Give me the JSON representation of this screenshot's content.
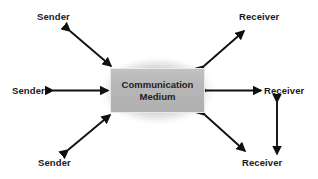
{
  "diagram": {
    "center_node": {
      "label": "Communication\nMedium",
      "fill_color": "#b7b7b7",
      "border_color": "#e9e9e9"
    },
    "senders": [
      {
        "id": "sender-top",
        "label": "Sender"
      },
      {
        "id": "sender-mid",
        "label": "Sender"
      },
      {
        "id": "sender-bottom",
        "label": "Sender"
      }
    ],
    "receivers": [
      {
        "id": "receiver-top",
        "label": "Receiver"
      },
      {
        "id": "receiver-mid",
        "label": "Receiver"
      },
      {
        "id": "receiver-bottom",
        "label": "Receiver"
      }
    ],
    "connectors": [
      {
        "id": "arrow-sender-top-diagonal",
        "type": "double-headed-arrow",
        "direction": "diagonal-down-right"
      },
      {
        "id": "arrow-sender-mid-horizontal",
        "type": "double-headed-arrow",
        "direction": "horizontal"
      },
      {
        "id": "arrow-sender-bottom-diagonal",
        "type": "double-headed-arrow",
        "direction": "diagonal-up-right"
      },
      {
        "id": "arrow-receiver-top-diagonal",
        "type": "double-headed-arrow",
        "direction": "diagonal-up-right"
      },
      {
        "id": "arrow-receiver-mid-horizontal",
        "type": "double-headed-arrow",
        "direction": "horizontal"
      },
      {
        "id": "arrow-receiver-bottom-diagonal",
        "type": "double-headed-arrow",
        "direction": "diagonal-down-right"
      },
      {
        "id": "arrow-receiver-vertical",
        "type": "double-headed-arrow",
        "direction": "vertical"
      }
    ],
    "colors": {
      "background": "#ffffff",
      "arrow": "#101010",
      "text": "#1a1a1a"
    }
  }
}
